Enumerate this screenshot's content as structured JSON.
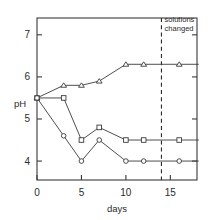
{
  "chart_data": {
    "type": "line",
    "title": "",
    "xlabel": "days",
    "ylabel": "pH",
    "xlim": [
      0,
      18
    ],
    "ylim": [
      3.55,
      7.4
    ],
    "xticks": [
      0,
      5,
      10,
      15
    ],
    "yticks": [
      4,
      5,
      6,
      7
    ],
    "xticklabels": [
      "0",
      "5",
      "10",
      "15"
    ],
    "yticklabels": [
      "4",
      "5",
      "6",
      "7"
    ],
    "grid": false,
    "legend": "none",
    "series": [
      {
        "name": "triangles",
        "marker": "triangle-up",
        "x": [
          0,
          3,
          5,
          7,
          10,
          12,
          16
        ],
        "y": [
          5.5,
          5.8,
          5.8,
          5.9,
          6.3,
          6.3,
          6.3
        ]
      },
      {
        "name": "squares",
        "marker": "square",
        "x": [
          0,
          3,
          5,
          7,
          10,
          12,
          16
        ],
        "y": [
          5.5,
          5.5,
          4.5,
          4.8,
          4.5,
          4.5,
          4.5
        ]
      },
      {
        "name": "circles",
        "marker": "circle",
        "x": [
          0,
          3,
          5,
          7,
          10,
          12,
          16
        ],
        "y": [
          5.5,
          4.6,
          4.0,
          4.5,
          4.0,
          4.0,
          4.0
        ]
      }
    ],
    "annotations": [
      {
        "name": "solutions-changed",
        "text_line1": "solutions",
        "text_line2": "changed",
        "x": 14,
        "style": "dashed-vline"
      }
    ],
    "colors": {
      "frame": "#3a3a3a",
      "line": "#3a3a3a",
      "marker_fill": "#ffffff",
      "text": "#2b2b2b",
      "background": "#ffffff"
    }
  }
}
